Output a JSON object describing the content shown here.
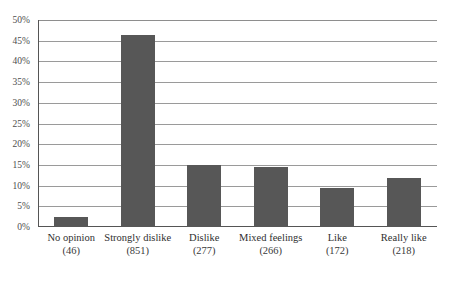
{
  "chart_data": {
    "type": "bar",
    "title": "",
    "subtitle": "",
    "xlabel": "",
    "ylabel": "",
    "categories": [
      "No opinion",
      "Strongly dislike",
      "Dislike",
      "Mixed feelings",
      "Like",
      "Really like"
    ],
    "counts": [
      46,
      851,
      277,
      266,
      172,
      218
    ],
    "count_labels": [
      "(46)",
      "(851)",
      "(277)",
      "(266)",
      "(172)",
      "(218)"
    ],
    "values": [
      2.5,
      46.5,
      15.1,
      14.5,
      9.4,
      11.9
    ],
    "ylim": [
      0,
      50
    ],
    "ytick_values": [
      0,
      5,
      10,
      15,
      20,
      25,
      30,
      35,
      40,
      45,
      50
    ],
    "ytick_labels": [
      "0%",
      "5%",
      "10%",
      "15%",
      "20%",
      "25%",
      "30%",
      "35%",
      "40%",
      "45%",
      "50%"
    ],
    "grid": true,
    "legend": false,
    "legend_position": "none",
    "bar_color": "#575757",
    "gridline_color": "#9a9a9a",
    "axis_color": "#555555",
    "background_color": "#ffffff"
  }
}
